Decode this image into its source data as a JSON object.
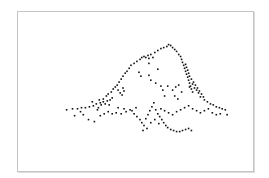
{
  "chart_data": {
    "type": "scatter",
    "title": "",
    "xlabel": "",
    "ylabel": "",
    "xlim": [
      0,
      100
    ],
    "ylim": [
      0,
      100
    ],
    "grid": false,
    "legend": "none",
    "axes_visible": false,
    "frame_color": "#c4c4c4",
    "point_color": "#111111",
    "series": [
      {
        "name": "point-cloud",
        "points": [
          [
            20.7,
            38.5
          ],
          [
            23.2,
            39.1
          ],
          [
            25.3,
            39.1
          ],
          [
            27.0,
            39.8
          ],
          [
            28.7,
            39.8
          ],
          [
            30.4,
            40.4
          ],
          [
            32.1,
            41.0
          ],
          [
            33.3,
            42.2
          ],
          [
            34.2,
            39.8
          ],
          [
            35.4,
            41.6
          ],
          [
            36.3,
            43.5
          ],
          [
            37.1,
            42.2
          ],
          [
            38.0,
            44.1
          ],
          [
            38.8,
            41.6
          ],
          [
            39.2,
            44.7
          ],
          [
            40.1,
            46.0
          ],
          [
            37.6,
            47.2
          ],
          [
            38.4,
            48.4
          ],
          [
            39.7,
            49.7
          ],
          [
            40.5,
            51.6
          ],
          [
            41.4,
            52.8
          ],
          [
            42.2,
            54.0
          ],
          [
            43.0,
            55.9
          ],
          [
            43.9,
            57.8
          ],
          [
            44.7,
            59.6
          ],
          [
            45.6,
            61.5
          ],
          [
            42.6,
            50.9
          ],
          [
            43.5,
            49.1
          ],
          [
            44.3,
            47.8
          ],
          [
            45.1,
            50.3
          ],
          [
            44.7,
            52.2
          ],
          [
            46.4,
            62.7
          ],
          [
            47.3,
            64.6
          ],
          [
            48.1,
            66.5
          ],
          [
            49.4,
            67.7
          ],
          [
            50.6,
            68.9
          ],
          [
            51.9,
            70.2
          ],
          [
            52.7,
            71.4
          ],
          [
            53.6,
            72.0
          ],
          [
            54.4,
            71.4
          ],
          [
            55.3,
            72.7
          ],
          [
            55.7,
            70.8
          ],
          [
            56.5,
            73.3
          ],
          [
            57.4,
            71.4
          ],
          [
            55.7,
            67.7
          ],
          [
            58.2,
            74.5
          ],
          [
            59.5,
            75.8
          ],
          [
            60.8,
            77.0
          ],
          [
            62.0,
            77.6
          ],
          [
            63.3,
            78.3
          ],
          [
            64.1,
            79.5
          ],
          [
            65.0,
            78.9
          ],
          [
            65.8,
            77.6
          ],
          [
            66.7,
            76.4
          ],
          [
            67.5,
            75.2
          ],
          [
            68.4,
            73.3
          ],
          [
            69.2,
            72.0
          ],
          [
            69.6,
            70.2
          ],
          [
            70.0,
            68.3
          ],
          [
            70.5,
            66.5
          ],
          [
            70.9,
            64.6
          ],
          [
            71.3,
            62.7
          ],
          [
            71.7,
            60.9
          ],
          [
            72.2,
            59.0
          ],
          [
            72.6,
            57.1
          ],
          [
            73.0,
            55.3
          ],
          [
            73.4,
            53.4
          ],
          [
            73.8,
            51.6
          ],
          [
            74.3,
            49.7
          ],
          [
            71.3,
            67.1
          ],
          [
            71.7,
            65.2
          ],
          [
            72.2,
            63.4
          ],
          [
            72.6,
            61.5
          ],
          [
            73.0,
            59.6
          ],
          [
            73.8,
            57.8
          ],
          [
            74.7,
            55.9
          ],
          [
            75.5,
            54.0
          ],
          [
            76.4,
            52.2
          ],
          [
            77.2,
            50.3
          ],
          [
            78.1,
            48.4
          ],
          [
            78.9,
            46.6
          ],
          [
            73.0,
            52.8
          ],
          [
            74.3,
            54.7
          ],
          [
            75.1,
            52.2
          ],
          [
            76.0,
            50.9
          ],
          [
            76.8,
            49.1
          ],
          [
            77.6,
            46.6
          ],
          [
            79.3,
            44.7
          ],
          [
            80.6,
            43.5
          ],
          [
            81.9,
            42.2
          ],
          [
            83.1,
            41.6
          ],
          [
            84.4,
            40.4
          ],
          [
            85.7,
            39.8
          ],
          [
            86.9,
            39.1
          ],
          [
            88.2,
            38.5
          ],
          [
            89.0,
            35.4
          ],
          [
            65.8,
            50.9
          ],
          [
            67.1,
            52.8
          ],
          [
            68.4,
            54.0
          ],
          [
            69.6,
            49.7
          ],
          [
            66.7,
            47.2
          ],
          [
            68.0,
            45.3
          ],
          [
            62.4,
            47.2
          ],
          [
            61.6,
            50.9
          ],
          [
            63.7,
            53.4
          ],
          [
            59.5,
            64.0
          ],
          [
            55.7,
            60.2
          ],
          [
            56.5,
            57.1
          ],
          [
            58.6,
            55.3
          ],
          [
            60.8,
            53.4
          ],
          [
            51.5,
            62.1
          ],
          [
            52.3,
            59.6
          ],
          [
            27.8,
            35.4
          ],
          [
            30.0,
            32.3
          ],
          [
            32.5,
            31.1
          ],
          [
            35.0,
            34.8
          ],
          [
            36.7,
            36.0
          ],
          [
            38.4,
            37.3
          ],
          [
            40.1,
            36.0
          ],
          [
            41.8,
            36.6
          ],
          [
            43.9,
            36.0
          ],
          [
            46.0,
            37.3
          ],
          [
            47.7,
            38.5
          ],
          [
            49.4,
            36.0
          ],
          [
            50.6,
            34.2
          ],
          [
            51.9,
            32.3
          ],
          [
            52.7,
            30.4
          ],
          [
            53.6,
            28.6
          ],
          [
            54.4,
            32.9
          ],
          [
            55.3,
            35.4
          ],
          [
            56.1,
            37.9
          ],
          [
            57.0,
            40.4
          ],
          [
            57.8,
            42.9
          ],
          [
            58.6,
            38.5
          ],
          [
            59.5,
            36.0
          ],
          [
            60.3,
            34.2
          ],
          [
            61.2,
            32.3
          ],
          [
            62.0,
            30.4
          ],
          [
            62.9,
            28.6
          ],
          [
            63.7,
            27.3
          ],
          [
            65.0,
            26.1
          ],
          [
            66.2,
            25.5
          ],
          [
            67.5,
            24.8
          ],
          [
            68.8,
            24.8
          ],
          [
            70.0,
            25.5
          ],
          [
            71.3,
            26.1
          ],
          [
            72.6,
            26.7
          ],
          [
            73.8,
            25.5
          ],
          [
            60.8,
            39.1
          ],
          [
            62.4,
            37.9
          ],
          [
            64.1,
            36.6
          ],
          [
            65.8,
            35.4
          ],
          [
            67.5,
            37.3
          ],
          [
            69.2,
            38.5
          ],
          [
            70.9,
            39.8
          ],
          [
            72.6,
            41.0
          ],
          [
            74.3,
            39.1
          ],
          [
            76.0,
            37.9
          ],
          [
            77.6,
            36.6
          ],
          [
            79.3,
            37.9
          ],
          [
            81.0,
            39.1
          ],
          [
            82.7,
            36.6
          ],
          [
            84.4,
            35.4
          ],
          [
            86.1,
            36.0
          ],
          [
            54.9,
            26.7
          ],
          [
            53.2,
            25.5
          ],
          [
            56.5,
            30.4
          ],
          [
            58.2,
            32.3
          ],
          [
            59.9,
            29.8
          ],
          [
            48.5,
            37.9
          ],
          [
            50.2,
            39.8
          ],
          [
            45.1,
            39.1
          ],
          [
            42.6,
            39.8
          ],
          [
            24.1,
            34.8
          ],
          [
            26.6,
            37.3
          ],
          [
            33.8,
            38.5
          ],
          [
            35.0,
            42.9
          ],
          [
            36.3,
            45.3
          ],
          [
            34.6,
            44.7
          ],
          [
            31.6,
            43.5
          ]
        ]
      }
    ]
  }
}
